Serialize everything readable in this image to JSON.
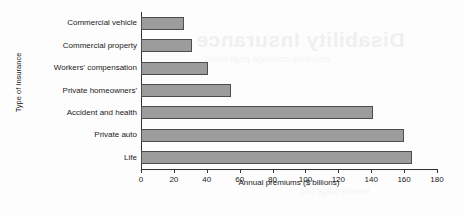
{
  "chart_data": {
    "type": "bar",
    "orientation": "horizontal",
    "title": "",
    "xlabel": "Annual premiums ($ billions)",
    "ylabel": "Type of Insurance",
    "categories": [
      "Commercial vehicle",
      "Commercial property",
      "Workers' compensation",
      "Private homeowners'",
      "Accident and health",
      "Private auto",
      "Life"
    ],
    "values": [
      26,
      31,
      41,
      55,
      141,
      160,
      165
    ],
    "xlim": [
      0,
      180
    ],
    "xticks": [
      0,
      20,
      40,
      60,
      80,
      100,
      120,
      140,
      160,
      180
    ],
    "xtick_labels": [
      "0",
      "20",
      "40",
      "60",
      "80",
      "100",
      "120",
      "140",
      "160",
      "180"
    ],
    "grid": false,
    "legend": null,
    "bar_color": "#9c9c9c",
    "bar_edge_color": "#4d4d4d",
    "axis_color": "#333333",
    "background": "#fdfdfd"
  },
  "artifacts": {
    "bleed_heading": "Disability Insurance",
    "bleed_line_1": "insurance coverage page bleed",
    "bleed_line_2": "reverse page text"
  }
}
